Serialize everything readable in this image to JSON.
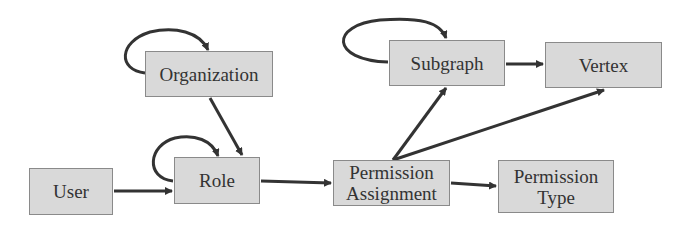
{
  "diagram": {
    "colors": {
      "node_fill": "#d9d9d9",
      "node_border": "#8a8a8a",
      "edge": "#333333",
      "text": "#333333"
    },
    "nodes": [
      {
        "id": "organization",
        "label": "Organization"
      },
      {
        "id": "user",
        "label": "User"
      },
      {
        "id": "role",
        "label": "Role"
      },
      {
        "id": "permission_assignment",
        "label_line1": "Permission",
        "label_line2": "Assignment"
      },
      {
        "id": "permission_type",
        "label_line1": "Permission",
        "label_line2": "Type"
      },
      {
        "id": "subgraph",
        "label": "Subgraph"
      },
      {
        "id": "vertex",
        "label": "Vertex"
      }
    ],
    "edges": [
      {
        "from": "organization",
        "to": "organization"
      },
      {
        "from": "organization",
        "to": "role"
      },
      {
        "from": "role",
        "to": "role"
      },
      {
        "from": "user",
        "to": "role"
      },
      {
        "from": "role",
        "to": "permission_assignment"
      },
      {
        "from": "permission_assignment",
        "to": "permission_type"
      },
      {
        "from": "permission_assignment",
        "to": "subgraph"
      },
      {
        "from": "permission_assignment",
        "to": "vertex"
      },
      {
        "from": "subgraph",
        "to": "subgraph"
      },
      {
        "from": "subgraph",
        "to": "vertex"
      }
    ]
  }
}
